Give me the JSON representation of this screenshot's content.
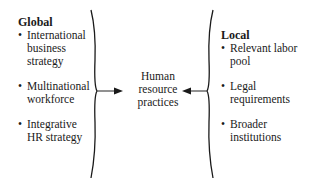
{
  "diagram": {
    "global": {
      "heading": "Global",
      "items": [
        {
          "bullet": "•",
          "lines": [
            "International",
            "business",
            "strategy"
          ]
        },
        {
          "bullet": "•",
          "lines": [
            "Multinational",
            "workforce"
          ]
        },
        {
          "bullet": "•",
          "lines": [
            "Integrative",
            "HR strategy"
          ]
        }
      ]
    },
    "center": {
      "lines": [
        "Human",
        "resource",
        "practices"
      ]
    },
    "local": {
      "heading": "Local",
      "items": [
        {
          "bullet": "•",
          "lines": [
            "Relevant labor",
            "pool"
          ]
        },
        {
          "bullet": "•",
          "lines": [
            "Legal",
            "requirements"
          ]
        },
        {
          "bullet": "•",
          "lines": [
            "Broader",
            "institutions"
          ]
        }
      ]
    },
    "connectors": {
      "left_brace_icon": "right-curly-brace",
      "right_brace_icon": "left-curly-brace",
      "left_arrow_icon": "arrow-right",
      "right_arrow_icon": "arrow-left"
    }
  }
}
